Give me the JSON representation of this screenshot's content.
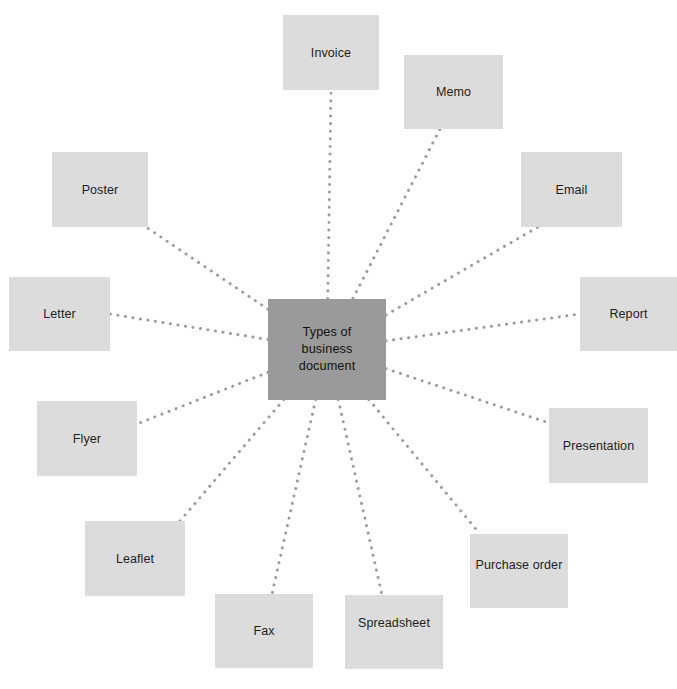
{
  "diagram": {
    "type": "radial-hub-and-spoke",
    "title": "Types of business document",
    "canvas": {
      "width": 677,
      "height": 689,
      "background": "#ffffff"
    },
    "colors": {
      "hub_fill": "#9a9a9a",
      "node_fill": "#dcdcdc",
      "connector": "#9e9e9e",
      "text": "#1d1d1d"
    },
    "hub": {
      "label": "Types of\nbusiness\ndocument",
      "x": 268,
      "y": 299,
      "width": 118,
      "height": 101,
      "center_x": 327,
      "center_y": 349
    },
    "nodes": [
      {
        "id": "invoice",
        "label": "Invoice",
        "x": 283,
        "y": 15,
        "width": 96,
        "height": 75,
        "anchor_x": 331,
        "anchor_y": 90,
        "valign": "center"
      },
      {
        "id": "memo",
        "label": "Memo",
        "x": 404,
        "y": 55,
        "width": 99,
        "height": 74,
        "anchor_x": 440,
        "anchor_y": 129,
        "valign": "center"
      },
      {
        "id": "email",
        "label": "Email",
        "x": 521,
        "y": 152,
        "width": 101,
        "height": 75,
        "anchor_x": 538,
        "anchor_y": 227,
        "valign": "center"
      },
      {
        "id": "report",
        "label": "Report",
        "x": 580,
        "y": 277,
        "width": 97,
        "height": 74,
        "anchor_x": 580,
        "anchor_y": 314,
        "valign": "center"
      },
      {
        "id": "presentation",
        "label": "Presentation",
        "x": 549,
        "y": 408,
        "width": 99,
        "height": 75,
        "anchor_x": 552,
        "anchor_y": 424,
        "valign": "center"
      },
      {
        "id": "purchase-order",
        "label": "Purchase order",
        "x": 470,
        "y": 534,
        "width": 98,
        "height": 74,
        "anchor_x": 480,
        "anchor_y": 534,
        "valign": "up-9"
      },
      {
        "id": "spreadsheet",
        "label": "Spreadsheet",
        "x": 345,
        "y": 595,
        "width": 98,
        "height": 74,
        "anchor_x": 382,
        "anchor_y": 595,
        "valign": "up-12"
      },
      {
        "id": "fax",
        "label": "Fax",
        "x": 215,
        "y": 594,
        "width": 98,
        "height": 74,
        "anchor_x": 272,
        "anchor_y": 594,
        "valign": "center"
      },
      {
        "id": "leaflet",
        "label": "Leaflet",
        "x": 85,
        "y": 521,
        "width": 100,
        "height": 75,
        "anchor_x": 180,
        "anchor_y": 521,
        "valign": "center"
      },
      {
        "id": "flyer",
        "label": "Flyer",
        "x": 37,
        "y": 401,
        "width": 100,
        "height": 75,
        "anchor_x": 137,
        "anchor_y": 424,
        "valign": "center"
      },
      {
        "id": "letter",
        "label": "Letter",
        "x": 9,
        "y": 277,
        "width": 101,
        "height": 74,
        "anchor_x": 110,
        "anchor_y": 314,
        "valign": "center"
      },
      {
        "id": "poster",
        "label": "Poster",
        "x": 52,
        "y": 152,
        "width": 96,
        "height": 75,
        "anchor_x": 146,
        "anchor_y": 227,
        "valign": "center"
      }
    ],
    "connectors": [
      {
        "from": "hub",
        "to": "invoice",
        "style": "dotted"
      },
      {
        "from": "hub",
        "to": "memo",
        "style": "dotted"
      },
      {
        "from": "hub",
        "to": "email",
        "style": "dotted"
      },
      {
        "from": "hub",
        "to": "report",
        "style": "dotted"
      },
      {
        "from": "hub",
        "to": "presentation",
        "style": "dotted"
      },
      {
        "from": "hub",
        "to": "purchase-order",
        "style": "dotted"
      },
      {
        "from": "hub",
        "to": "spreadsheet",
        "style": "dotted"
      },
      {
        "from": "hub",
        "to": "fax",
        "style": "dotted"
      },
      {
        "from": "hub",
        "to": "leaflet",
        "style": "dotted"
      },
      {
        "from": "hub",
        "to": "flyer",
        "style": "dotted"
      },
      {
        "from": "hub",
        "to": "letter",
        "style": "dotted"
      },
      {
        "from": "hub",
        "to": "poster",
        "style": "dotted"
      }
    ]
  }
}
